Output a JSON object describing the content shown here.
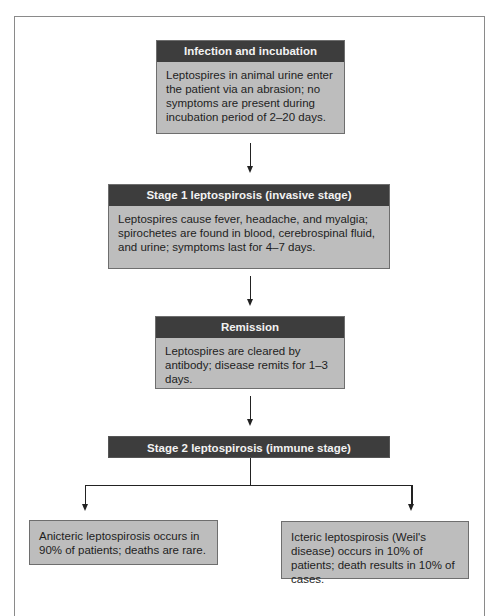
{
  "diagram": {
    "type": "flowchart",
    "nodes": [
      {
        "id": "infection",
        "title": "Infection and incubation",
        "text": "Leptospires in animal urine enter the patient via an abrasion; no symptoms are present during incubation period of 2–20 days."
      },
      {
        "id": "stage1",
        "title": "Stage 1 leptospirosis (invasive stage)",
        "text": "Leptospires cause fever, headache, and myalgia; spirochetes are found in blood, cerebrospinal fluid, and urine; symptoms last for 4–7 days."
      },
      {
        "id": "remission",
        "title": "Remission",
        "text": "Leptospires are cleared by antibody; disease remits for 1–3 days."
      },
      {
        "id": "stage2",
        "title": "Stage 2 leptospirosis (immune stage)"
      },
      {
        "id": "anicteric",
        "text": "Anicteric leptospirosis occurs in 90% of patients; deaths are rare."
      },
      {
        "id": "icteric",
        "text": "Icteric leptospirosis (Weil's disease) occurs in 10% of patients; death results in 10% of cases."
      }
    ],
    "edges": [
      {
        "from": "infection",
        "to": "stage1"
      },
      {
        "from": "stage1",
        "to": "remission"
      },
      {
        "from": "remission",
        "to": "stage2"
      },
      {
        "from": "stage2",
        "to": "anicteric"
      },
      {
        "from": "stage2",
        "to": "icteric"
      }
    ],
    "colors": {
      "header_bg": "#3d3d3d",
      "header_text": "#f2f2f2",
      "box_bg": "#bdbdbd",
      "frame": "#8a8a8a"
    }
  }
}
